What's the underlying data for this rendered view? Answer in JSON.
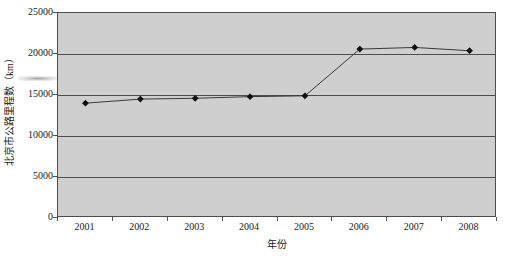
{
  "chart_data": {
    "type": "line",
    "title": "",
    "xlabel": "年份",
    "ylabel": "北京市公路里程数（km）",
    "categories": [
      "2001",
      "2002",
      "2003",
      "2004",
      "2005",
      "2006",
      "2007",
      "2008"
    ],
    "values": [
      14000,
      14500,
      14600,
      14800,
      14900,
      20600,
      20800,
      20400
    ],
    "series": [
      {
        "name": "北京市公路里程数",
        "values": [
          14000,
          14500,
          14600,
          14800,
          14900,
          20600,
          20800,
          20400
        ]
      }
    ],
    "ylim": [
      0,
      25000
    ],
    "ytick_labels": [
      "0",
      "5000",
      "10000",
      "15000",
      "20000",
      "25000"
    ],
    "ytick_values": [
      0,
      5000,
      10000,
      15000,
      20000,
      25000
    ],
    "xtick_labels": [
      "2001",
      "2002",
      "2003",
      "2004",
      "2005",
      "2006",
      "2007",
      "2008"
    ],
    "grid": "horizontal",
    "legend": "none",
    "marker": "filled-diamond",
    "colors": {
      "plot_background": "#d3d3d3",
      "gridline": "#4d4d4d",
      "axis": "#4d4d4d",
      "series_line": "#3a3a3a",
      "marker": "#111111",
      "text": "#1a1a1a",
      "page_background": "#ffffff"
    }
  },
  "axes": {
    "y_title": "北京市公路里程数（km）",
    "x_title": "年份",
    "y_ticks": [
      {
        "label": "25000",
        "value": 25000
      },
      {
        "label": "20000",
        "value": 20000
      },
      {
        "label": "15000",
        "value": 15000
      },
      {
        "label": "10000",
        "value": 10000
      },
      {
        "label": "5000",
        "value": 5000
      },
      {
        "label": "0",
        "value": 0
      }
    ],
    "x_ticks": [
      {
        "label": "2001"
      },
      {
        "label": "2002"
      },
      {
        "label": "2003"
      },
      {
        "label": "2004"
      },
      {
        "label": "2005"
      },
      {
        "label": "2006"
      },
      {
        "label": "2007"
      },
      {
        "label": "2008"
      }
    ]
  }
}
